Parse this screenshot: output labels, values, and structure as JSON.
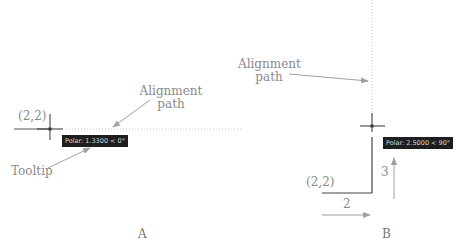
{
  "panel_a": {
    "coord_label": "(2,2)",
    "alignment_label_line1": "Alignment",
    "alignment_label_line2": "path",
    "tooltip_callout": "Tooltip",
    "tooltip_text": "Polar: 1.3300 < 0°",
    "caption": "A"
  },
  "panel_b": {
    "coord_label": "(2,2)",
    "alignment_label_line1": "Alignment",
    "alignment_label_line2": "path",
    "tooltip_text": "Polar: 2.5000 < 90°",
    "dim_horizontal": "2",
    "dim_vertical": "3",
    "caption": "B"
  },
  "colors": {
    "arrow": "#a0a0a0",
    "crosshair": "#333333",
    "tooltip_bg": "#1e1e1e",
    "alignment_path": "#cccccc"
  }
}
